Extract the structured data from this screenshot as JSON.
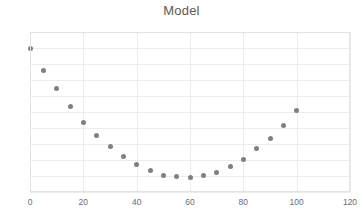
{
  "chart": {
    "title": "Model",
    "background_color": "#ffffff",
    "title_color": "#5a5a5a",
    "grid_color": "#ececec",
    "frame_color": "#e2e2e2",
    "marker_color": "#808080",
    "tick_label_color": "#6e6e6e"
  },
  "chart_data": {
    "type": "scatter",
    "title": "Model",
    "xlabel": "",
    "ylabel": "",
    "xlim": [
      0,
      120
    ],
    "ylim": [
      0,
      100
    ],
    "xticks": [
      0,
      20,
      40,
      60,
      80,
      100,
      120
    ],
    "yticks": [
      0,
      10,
      20,
      30,
      40,
      50,
      60,
      70,
      80,
      90,
      100
    ],
    "grid": true,
    "legend": false,
    "series": [
      {
        "name": "Model",
        "marker": "circle",
        "color": "#808080",
        "x": [
          0,
          5,
          10,
          15,
          20,
          25,
          30,
          35,
          40,
          45,
          50,
          55,
          60,
          65,
          70,
          75,
          80,
          85,
          90,
          95,
          100
        ],
        "y": [
          89.5,
          76.0,
          64.5,
          53.5,
          43.5,
          35.5,
          28.5,
          22.0,
          17.0,
          13.5,
          10.5,
          9.5,
          9.0,
          10.5,
          12.5,
          16.0,
          20.5,
          27.0,
          33.5,
          41.5,
          51.0
        ]
      }
    ]
  }
}
